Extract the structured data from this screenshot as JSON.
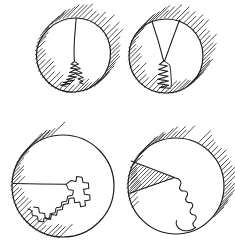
{
  "figure": {
    "type": "line-diagram",
    "canvas": {
      "width": 235,
      "height": 244,
      "background": "#ffffff"
    },
    "style": {
      "stroke_color": "#1a1a1a",
      "hatch_color": "#2b2b2b",
      "outline_width": 1.15,
      "curve_width": 1.05,
      "hatch_width": 0.85,
      "fill": "none",
      "hand_drawn": "true"
    },
    "layout": {
      "rows": 2,
      "columns": 2,
      "panel_count": 4
    },
    "panels": [
      {
        "id": "panel-top-left",
        "index": "1",
        "label": "",
        "circle": {
          "cx": 73,
          "cy": 55,
          "r": 37
        },
        "exterior_hatch": {
          "angle_deg": 45,
          "coverage": "full-ring",
          "band": 17,
          "spacing": 4.0
        },
        "feature": "vertical-slit-with-fractal-tail",
        "slit": {
          "from_x": 76,
          "from_y": 18,
          "to_x": 74,
          "to_y": 63
        },
        "fractal_tail": {
          "direction": "down-left",
          "teeth": 9,
          "amplitude": 7
        }
      },
      {
        "id": "panel-top-right",
        "index": "2",
        "label": "",
        "circle": {
          "cx": 166,
          "cy": 56,
          "r": 37
        },
        "exterior_hatch": {
          "angle_deg": 45,
          "coverage": "full-ring",
          "band": 17,
          "spacing": 4.0
        },
        "feature": "narrow-wedge-with-zigzag-tail",
        "wedge": {
          "apex_x": 164,
          "apex_y": 61,
          "left_x": 152,
          "left_y": 21,
          "right_x": 179,
          "right_y": 20
        },
        "fractal_tail": {
          "direction": "down",
          "teeth": 8,
          "amplitude": 8
        }
      },
      {
        "id": "panel-bottom-left",
        "index": "3",
        "label": "",
        "circle": {
          "cx": 63,
          "cy": 186,
          "r": 51
        },
        "exterior_hatch": {
          "angle_deg": 45,
          "coverage": "lower-left-arc",
          "band": 16,
          "spacing": 4.0
        },
        "feature": "horizontal-chord-with-fractal-staircase",
        "chord": {
          "from_x": 14,
          "from_y": 184,
          "to_x": 66,
          "to_y": 184
        },
        "fractal_tail": {
          "direction": "down-left",
          "teeth": 14,
          "amplitude": 10
        }
      },
      {
        "id": "panel-bottom-right",
        "index": "4",
        "label": "",
        "circle": {
          "cx": 176,
          "cy": 186,
          "r": 48
        },
        "exterior_hatch": {
          "angle_deg": 45,
          "coverage": "upper-and-lower-arc",
          "band": 15,
          "spacing": 4.0
        },
        "feature": "hatched-triangular-wedge-with-wavy-tail",
        "wedge": {
          "apex_x": 175,
          "apex_y": 178,
          "left_x": 131,
          "left_y": 162,
          "bottom_x": 130,
          "bottom_y": 194
        },
        "wedge_hatched": "true",
        "fractal_tail": {
          "direction": "down-around",
          "waves": 7,
          "amplitude": 7
        }
      }
    ]
  }
}
